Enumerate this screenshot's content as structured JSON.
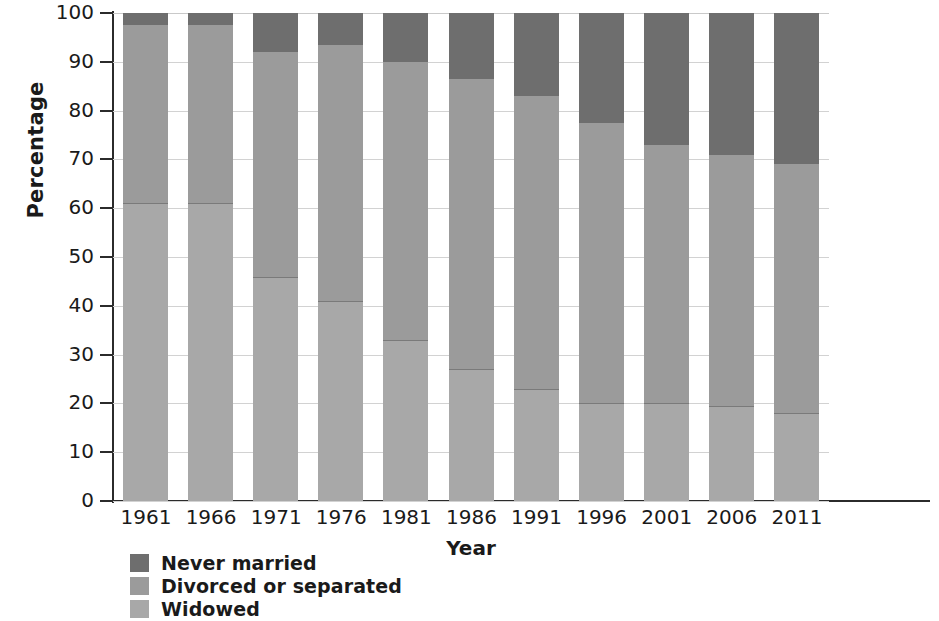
{
  "chart_data": {
    "type": "bar",
    "subtype": "stacked-bar-100",
    "title": "",
    "xlabel": "Year",
    "ylabel": "Percentage",
    "categories": [
      "1961",
      "1966",
      "1971",
      "1976",
      "1981",
      "1986",
      "1991",
      "1996",
      "2001",
      "2006",
      "2011"
    ],
    "ylim": [
      0,
      100
    ],
    "yticks": [
      0,
      10,
      20,
      30,
      40,
      50,
      60,
      70,
      80,
      90,
      100
    ],
    "ytick_labels": [
      "0",
      "10",
      "20",
      "30",
      "40",
      "50",
      "60",
      "70",
      "80",
      "90",
      "100"
    ],
    "grid": true,
    "legend_position": "bottom-left",
    "series": [
      {
        "name": "Widowed",
        "color": "#a8a8a8",
        "values": [
          61,
          61,
          46,
          41,
          33,
          27,
          23,
          20,
          20,
          19.5,
          18
        ]
      },
      {
        "name": "Divorced or separated",
        "color": "#9b9b9b",
        "values": [
          36.5,
          36.5,
          46,
          52.5,
          57,
          59.5,
          60,
          57.5,
          53,
          51.5,
          51
        ]
      },
      {
        "name": "Never married",
        "color": "#6e6e6e",
        "values": [
          2.5,
          2.5,
          8,
          6.5,
          10,
          13.5,
          17,
          22.5,
          27,
          29,
          31
        ]
      }
    ],
    "stack_tops": {
      "widowed": [
        61,
        61,
        46,
        41,
        33,
        27,
        23,
        20,
        20,
        19.5,
        18
      ],
      "widowed_plus_divorced": [
        97.5,
        97.5,
        92,
        93.5,
        90,
        86.5,
        83,
        77.5,
        73,
        71,
        69
      ]
    }
  },
  "legend": {
    "items": [
      {
        "label": "Never married",
        "color": "#6e6e6e"
      },
      {
        "label": "Divorced or separated",
        "color": "#9b9b9b"
      },
      {
        "label": "Widowed",
        "color": "#a8a8a8"
      }
    ]
  }
}
